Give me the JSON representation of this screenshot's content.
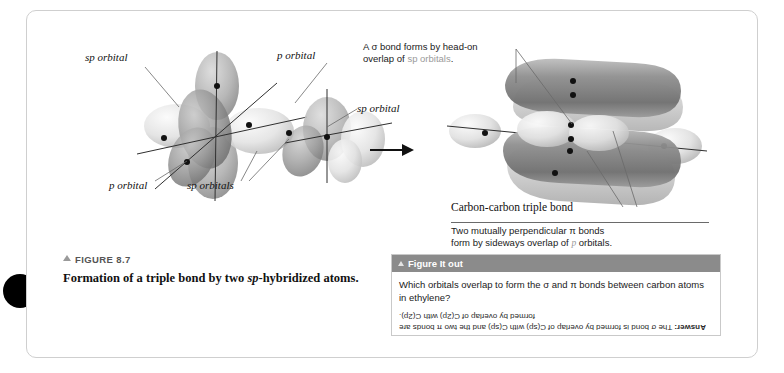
{
  "figure": {
    "number_label": "FIGURE 8.7",
    "caption_line1": "Formation of a triple bond by two ",
    "caption_italic": "sp",
    "caption_line2": "-hybridized",
    "caption_line3": "atoms."
  },
  "diagram": {
    "labels": {
      "sp_orbital_top_left": "sp orbital",
      "p_orbital_top_right": "p orbital",
      "sp_orbital_mid_right": "sp orbital",
      "p_orbital_bottom": "p orbital",
      "sp_orbitals_bottom": "sp orbitals",
      "carbon_carbon_triple_bond": "Carbon-carbon triple bond"
    },
    "callout_sigma": {
      "line1": "A σ bond forms by head-on",
      "line2_prefix": "overlap of ",
      "line2_dim": "sp orbitals",
      "line2_suffix": "."
    },
    "callout_pi": {
      "line1": "Two mutually perpendicular π bonds",
      "line2_prefix": "form by sideways overlap of ",
      "line2_dim": "p",
      "line2_suffix": " orbitals."
    },
    "arrow": "right-arrow"
  },
  "figure_it_out": {
    "header": "Figure It out",
    "question": "Which orbitals overlap to form the σ and π bonds between carbon atoms in ethylene?",
    "answer_label": "Answer:",
    "answer_text": " The σ bond is formed by overlap of C(sp) with C(sp) and the two π bonds are formed by overlap of C(2p) with C(2p)."
  },
  "colors": {
    "header_bar": "#8b8b8b",
    "orbital_dark": "#8a8a8a",
    "orbital_light": "#d8d8d8",
    "dim_text": "#9a9a9a"
  }
}
